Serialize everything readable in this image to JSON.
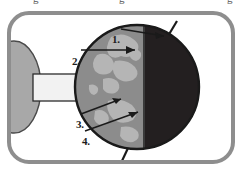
{
  "figure": {
    "title_fragment_above": "g           g",
    "frame": {
      "border_color": "#8e8e8e",
      "background_color": "#ffffff",
      "corner_radius": "22px"
    },
    "sun": {
      "name": "sun-half-oval",
      "fill_color": "#a8a8a8",
      "outline_color": "#4a4a4a"
    },
    "light_beam": {
      "name": "light-beam-cylinder",
      "fill_color": "#f2f2f2",
      "outline_color": "#2b2b2b"
    },
    "earth": {
      "name": "earth-sphere",
      "day_side_ocean_color": "#8c8c8c",
      "day_side_land_color": "#b5b5b5",
      "night_side_color": "#231f20",
      "outline_color": "#1a1a1a",
      "axis_color": "#1a1a1a",
      "terminator_label": "day-night-terminator"
    },
    "callouts": [
      {
        "id": "1",
        "label": "1.",
        "target": "north-pole-axis-top"
      },
      {
        "id": "2",
        "label": "2.",
        "target": "daylit-hemisphere-surface"
      },
      {
        "id": "3",
        "label": "3.",
        "target": "equatorial-region-upper"
      },
      {
        "id": "4",
        "label": "4.",
        "target": "equatorial-region-lower"
      }
    ]
  }
}
